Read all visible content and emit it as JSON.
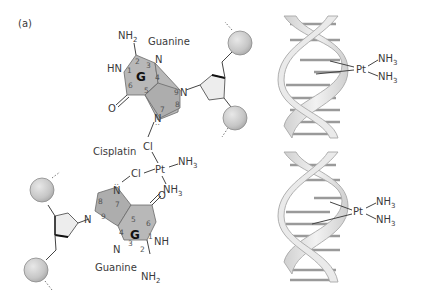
{
  "figure": {
    "panel_label": "(a)",
    "colors": {
      "ring_fill": "#b8b8b8",
      "bead_fill": "#cfcfcf",
      "helix_fill": "#e6e6e6",
      "helix_stroke": "#a8a8a8",
      "text": "#3a3a3a"
    }
  },
  "top_guanine": {
    "name": "Guanine",
    "ring_letter": "G",
    "amine": "NH",
    "amine_sub": "2",
    "hn": "HN",
    "oxygen": "O",
    "n3": "N",
    "n7": "N",
    "n9": "N",
    "atom_numbers": [
      "1",
      "2",
      "3",
      "4",
      "5",
      "6",
      "7",
      "8",
      "9"
    ]
  },
  "bottom_guanine": {
    "name": "Guanine",
    "ring_letter": "G",
    "amine": "NH",
    "amine_sub": "2",
    "nh": "NH",
    "oxygen": "O",
    "n3": "N",
    "n7": "N",
    "n9": "N",
    "atom_numbers": [
      "1",
      "2",
      "3",
      "4",
      "5",
      "6",
      "7",
      "8",
      "9"
    ]
  },
  "cisplatin": {
    "name": "Cisplatin",
    "metal": "Pt",
    "ligand_cl_top": "Cl",
    "ligand_cl_left": "Cl",
    "ligand_nh3_a": "NH",
    "ligand_nh3_a_sub": "3",
    "ligand_nh3_b": "NH",
    "ligand_nh3_b_sub": "3"
  },
  "helix_top": {
    "metal": "Pt",
    "ligand_a": "NH",
    "ligand_a_sub": "3",
    "ligand_b": "NH",
    "ligand_b_sub": "3"
  },
  "helix_bottom": {
    "metal": "Pt",
    "ligand_a": "NH",
    "ligand_a_sub": "3",
    "ligand_b": "NH",
    "ligand_b_sub": "3"
  }
}
